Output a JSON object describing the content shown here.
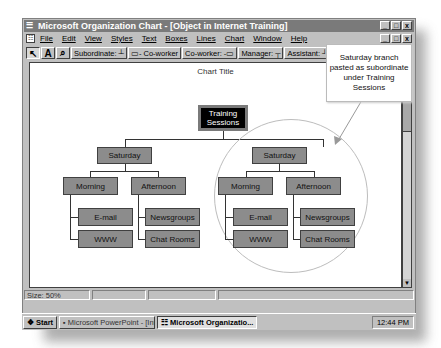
{
  "window": {
    "title": "Microsoft Organization Chart - [Object in Internet Training]",
    "controls": [
      "_",
      "□",
      "x"
    ]
  },
  "menubar": {
    "items": [
      "File",
      "Edit",
      "View",
      "Styles",
      "Text",
      "Boxes",
      "Lines",
      "Chart",
      "Window",
      "Help"
    ]
  },
  "toolbar": {
    "select_icon": "▲",
    "text_icon": "A",
    "zoom_icon": "🔍",
    "buttons": [
      "Subordinate: ┴",
      "▭- Co-worker",
      "Co-worker: -▭",
      "Manager: ┬",
      "Assistant: ┘"
    ]
  },
  "chart": {
    "title": "Chart Title",
    "root": "Training Sessions",
    "branches": [
      {
        "label": "Saturday",
        "children": [
          {
            "label": "Morning",
            "items": [
              "E-mail",
              "WWW"
            ]
          },
          {
            "label": "Afternoon",
            "items": [
              "Newsgroups",
              "Chat Rooms"
            ]
          }
        ]
      },
      {
        "label": "Saturday",
        "children": [
          {
            "label": "Morning",
            "items": [
              "E-mail",
              "WWW"
            ]
          },
          {
            "label": "Afternoon",
            "items": [
              "Newsgroups",
              "Chat Rooms"
            ]
          }
        ]
      }
    ]
  },
  "callout": {
    "text": "Saturday branch pasted as subordinate under Training Sessions"
  },
  "statusbar": {
    "size": "Size: 50%"
  },
  "taskbar": {
    "start": "Start",
    "tasks": [
      "Microsoft PowerPoint - [Int...",
      "Microsoft Organizatio..."
    ],
    "clock": "12:44 PM"
  },
  "colors": {
    "node_fill": "#8c8c8c",
    "root_fill": "#000000",
    "title_bar": "#7a7a7a"
  }
}
